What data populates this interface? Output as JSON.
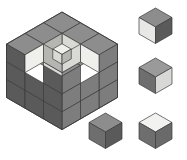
{
  "figure": {
    "background_color": "#ffffff",
    "outline_color": "#3a3a3a",
    "palette": {
      "top_dark": "#8d8d8d",
      "top_medium": "#9a9a9a",
      "top_light": "#f2f2f0",
      "left_dark": "#6e6e6e",
      "left_medium": "#7d7d7d",
      "left_light": "#e8e8e6",
      "right_dark": "#5a5a5a",
      "right_medium": "#6a6a6a",
      "right_light": "#d8d8d6",
      "void_top": "#efefec",
      "void_left": "#d9d9d6",
      "void_right": "#b5b5b2"
    }
  },
  "main_assembly": {
    "name": "main-cube-assembly",
    "label": "3x3x3 cube with voids",
    "grid": [
      3,
      3,
      3
    ],
    "origin": {
      "x": 62,
      "y": 12
    },
    "unit": {
      "hw": 18.5,
      "hh": 10.7,
      "vh": 17.8
    },
    "description": "Large isometric 3x3x3 block; several unit cubes removed from the near top corner creating a stepped cavity with pale interior faces.",
    "visible_top_cells": [
      {
        "u": 0,
        "v": 0,
        "shade": "top_dark"
      },
      {
        "u": 1,
        "v": 0,
        "shade": "top_dark"
      },
      {
        "u": 2,
        "v": 0,
        "shade": "top_dark"
      },
      {
        "u": 0,
        "v": 1,
        "shade": "top_dark"
      },
      {
        "u": 1,
        "v": 1,
        "shade": "top_dark"
      },
      {
        "u": 2,
        "v": 1,
        "shade": "top_dark"
      },
      {
        "u": 0,
        "v": 2,
        "shade": "top_dark"
      },
      {
        "u": 2,
        "v": 2,
        "shade": "top_dark"
      }
    ],
    "cavity_cells": [
      {
        "u": 1,
        "v": 2,
        "note": "removed top-center-front cube"
      }
    ],
    "front_left_face_rows": 3,
    "front_right_face_rows": 3
  },
  "candidate_cubes": [
    {
      "id": "cube-a",
      "name": "candidate-cube-a",
      "position_label": "top-right",
      "x": 139,
      "y": 8,
      "size": 1,
      "faces": {
        "top": "top_dark",
        "left": "left_light",
        "right": "right_dark"
      },
      "face_colors": {
        "top": "#8d8d8d",
        "left": "#e8e8e6",
        "right": "#5a5a5a"
      }
    },
    {
      "id": "cube-b",
      "name": "candidate-cube-b",
      "position_label": "middle-right",
      "x": 139,
      "y": 58,
      "size": 1,
      "faces": {
        "top": "top_medium",
        "left": "left_dark",
        "right": "right_light"
      },
      "face_colors": {
        "top": "#9a9a9a",
        "left": "#6e6e6e",
        "right": "#d8d8d6"
      }
    },
    {
      "id": "cube-c",
      "name": "candidate-cube-c",
      "position_label": "bottom-left",
      "x": 89,
      "y": 113,
      "size": 1,
      "faces": {
        "top": "top_dark",
        "left": "left_dark",
        "right": "right_dark"
      },
      "face_colors": {
        "top": "#8d8d8d",
        "left": "#6e6e6e",
        "right": "#5a5a5a"
      }
    },
    {
      "id": "cube-d",
      "name": "candidate-cube-d",
      "position_label": "bottom-right",
      "x": 139,
      "y": 113,
      "size": 1,
      "faces": {
        "top": "top_light",
        "left": "left_dark",
        "right": "right_medium"
      },
      "face_colors": {
        "top": "#f2f2f0",
        "left": "#6e6e6e",
        "right": "#6a6a6a"
      }
    }
  ]
}
